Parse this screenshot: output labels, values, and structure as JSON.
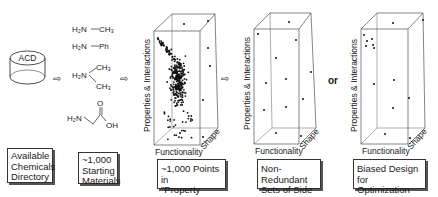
{
  "source": {
    "cylinder_label": "ACD",
    "caption_lines": [
      "Available",
      "Chemicals",
      "Directory"
    ]
  },
  "materials": {
    "structures": [
      {
        "left": "H₂N",
        "bond": "—",
        "right": "CH₃"
      },
      {
        "left": "H₂N",
        "bond": "—",
        "right": "Ph"
      },
      {
        "left": "H₂N",
        "branch_top": "CH₃",
        "branch_bottom": "CH₃"
      },
      {
        "left": "H₂N",
        "carbonyl_o": "O",
        "hydroxyl": "OH"
      }
    ],
    "caption_lines": [
      "~1,000",
      "Starting",
      "Materials"
    ]
  },
  "arrow_symbol": "⇨",
  "or_label": "or",
  "panels": [
    {
      "id": "property-space",
      "y_axis": "Properties & Interactions",
      "x_axis": "Functionality",
      "z_axis": "Shape",
      "caption_lines": [
        "~1,000 Points in",
        "\"Property Space\""
      ]
    },
    {
      "id": "non-redundant",
      "y_axis": "Properties & Interactions",
      "x_axis": "Functionality",
      "z_axis": "Shape",
      "caption_lines": [
        "Non-Redundant",
        "Sets of Side chains"
      ]
    },
    {
      "id": "biased",
      "y_axis": "Properties & Interactions",
      "x_axis": "Functionality",
      "z_axis": "Shape",
      "caption_lines": [
        "Biased Design",
        "for Optimization"
      ]
    }
  ]
}
